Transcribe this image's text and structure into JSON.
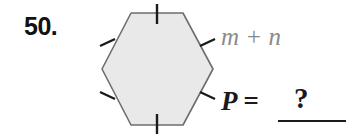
{
  "problem": {
    "number_label": "50.",
    "side_length_label": "m + n",
    "perimeter_label": "P  =",
    "answer_placeholder": "?"
  },
  "figure": {
    "shape_name": "regular-hexagon",
    "sides": 6,
    "fill_color": "#e9e9e9",
    "stroke_color": "#6e6e6e",
    "tick_color": "#1a1a1a",
    "tick_marks": 6,
    "vertices": [
      [
        131,
        13
      ],
      [
        183,
        13
      ],
      [
        213,
        69
      ],
      [
        183,
        125
      ],
      [
        131,
        125
      ],
      [
        102,
        69
      ]
    ],
    "tick_segments": [
      [
        157,
        4,
        157,
        24
      ],
      [
        201,
        46,
        214,
        40
      ],
      [
        201,
        92,
        214,
        98
      ],
      [
        157,
        114,
        157,
        134
      ],
      [
        101,
        92,
        114,
        98
      ],
      [
        101,
        46,
        114,
        40
      ]
    ]
  },
  "colors": {
    "background": "#ffffff",
    "number_text": "#111111",
    "side_label_text": "#8a8a8a",
    "perimeter_text": "#1a1a1a"
  }
}
